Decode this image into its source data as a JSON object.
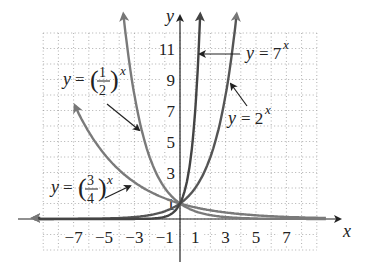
{
  "chart_data": {
    "type": "line",
    "title": "",
    "xlabel": "x",
    "ylabel": "y",
    "xlim": [
      -9,
      9
    ],
    "ylim": [
      -2,
      12
    ],
    "grid": true,
    "x_ticks": [
      "−7",
      "−5",
      "−3",
      "−1",
      "1",
      "3",
      "5",
      "7"
    ],
    "y_ticks": [
      "11",
      "9",
      "7",
      "5",
      "3",
      "1"
    ],
    "series": [
      {
        "name": "y = (1/2)^x",
        "base": 0.5,
        "color": "#7a7a7a"
      },
      {
        "name": "y = (3/4)^x",
        "base": 0.75,
        "color": "#7a7a7a"
      },
      {
        "name": "y = 2^x",
        "base": 2,
        "color": "#555555"
      },
      {
        "name": "y = 7^x",
        "base": 7,
        "color": "#444444"
      }
    ],
    "annotations": [
      {
        "text": "y = (1/2)^x",
        "points_to": "y = (1/2)^x"
      },
      {
        "text": "y = (3/4)^x",
        "points_to": "y = (3/4)^x"
      },
      {
        "text": "y = 2^x",
        "points_to": "y = 2^x"
      },
      {
        "text": "y = 7^x",
        "points_to": "y = 7^x"
      }
    ]
  },
  "labels": {
    "x_axis": "x",
    "y_axis": "y",
    "half": {
      "y": "y",
      "eq": "=",
      "num": "1",
      "den": "2",
      "exp": "x"
    },
    "threeq": {
      "y": "y",
      "eq": "=",
      "num": "3",
      "den": "4",
      "exp": "x"
    },
    "two": {
      "text": "y = 2",
      "exp": "x"
    },
    "seven": {
      "text": "y = 7",
      "exp": "x"
    }
  }
}
